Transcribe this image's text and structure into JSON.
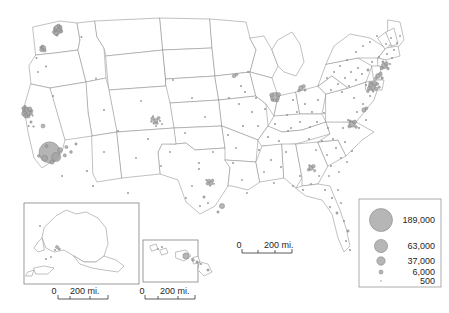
{
  "map": {
    "title": "United States population distribution dot/graduated-circle map",
    "background_color": "#ffffff",
    "state_outline_color": "#8d8d8d",
    "symbol_fill_color": "#a3a3a3",
    "symbol_stroke_color": "#787878"
  },
  "legend": {
    "name": "graduated-circle-legend",
    "border_color": "#8a8a8a",
    "entries": [
      {
        "label": "189,000",
        "radius": 11.5,
        "value": 189000
      },
      {
        "label": "63,000",
        "radius": 6.6,
        "value": 63000
      },
      {
        "label": "37,000",
        "radius": 4.2,
        "value": 37000
      },
      {
        "label": "6,000",
        "radius": 2.0,
        "value": 6000
      },
      {
        "label": "500",
        "radius": 0.8,
        "value": 500
      }
    ]
  },
  "scalebars": [
    {
      "name": "main-map-scalebar",
      "zero": "0",
      "distance": "200 mi."
    },
    {
      "name": "alaska-inset-scalebar",
      "zero": "0",
      "distance": "200 mi."
    },
    {
      "name": "hawaii-inset-scalebar",
      "zero": "0",
      "distance": "200 mi."
    }
  ],
  "insets": [
    {
      "name": "alaska-inset",
      "label": "Alaska"
    },
    {
      "name": "hawaii-inset",
      "label": "Hawaii"
    }
  ],
  "symbols": {
    "conus": [
      [
        55.5,
        30.0,
        2.2
      ],
      [
        57.8,
        28.4,
        3.6
      ],
      [
        59.4,
        30.6,
        2.9
      ],
      [
        56.2,
        33.0,
        2.6
      ],
      [
        60.1,
        27.2,
        2.0
      ],
      [
        53.8,
        32.1,
        1.5
      ],
      [
        58.6,
        25.6,
        1.6
      ],
      [
        61.3,
        31.4,
        1.4
      ],
      [
        57.0,
        35.0,
        1.2
      ],
      [
        54.4,
        27.8,
        1.1
      ],
      [
        43.2,
        48.0,
        2.6
      ],
      [
        41.6,
        49.8,
        2.0
      ],
      [
        44.6,
        50.4,
        1.6
      ],
      [
        42.2,
        46.3,
        1.3
      ],
      [
        40.4,
        47.4,
        1.0
      ],
      [
        36.5,
        58.0,
        1.0
      ],
      [
        81.5,
        37.0,
        1.0
      ],
      [
        46.0,
        66.5,
        1.0
      ],
      [
        38.0,
        72.0,
        0.9
      ],
      [
        96.0,
        78.5,
        0.9
      ],
      [
        53.0,
        96.0,
        1.0
      ],
      [
        104.0,
        110.0,
        1.0
      ],
      [
        25.6,
        110.0,
        3.2
      ],
      [
        27.4,
        112.4,
        4.0
      ],
      [
        24.2,
        113.6,
        2.6
      ],
      [
        29.6,
        109.0,
        2.2
      ],
      [
        26.0,
        115.8,
        2.4
      ],
      [
        30.8,
        113.0,
        1.8
      ],
      [
        23.4,
        108.2,
        1.6
      ],
      [
        28.4,
        116.4,
        1.5
      ],
      [
        31.8,
        110.6,
        1.2
      ],
      [
        25.0,
        106.4,
        1.2
      ],
      [
        32.6,
        115.4,
        1.0
      ],
      [
        31.0,
        122.0,
        1.2
      ],
      [
        28.6,
        126.0,
        1.0
      ],
      [
        43.0,
        126.0,
        2.0
      ],
      [
        33.5,
        126.5,
        1.1
      ],
      [
        49.6,
        152.4,
        10.6
      ],
      [
        56.2,
        157.0,
        4.6
      ],
      [
        44.6,
        158.2,
        3.0
      ],
      [
        60.0,
        150.0,
        2.4
      ],
      [
        52.0,
        162.0,
        2.2
      ],
      [
        64.8,
        155.4,
        1.6
      ],
      [
        46.6,
        146.0,
        1.5
      ],
      [
        38.8,
        156.0,
        1.4
      ],
      [
        66.4,
        147.0,
        1.6
      ],
      [
        71.0,
        152.0,
        1.4
      ],
      [
        76.0,
        144.0,
        1.2
      ],
      [
        87.0,
        171.0,
        1.1
      ],
      [
        62.0,
        176.0,
        1.0
      ],
      [
        93.0,
        186.0,
        1.0
      ],
      [
        128.0,
        193.0,
        1.0
      ],
      [
        118.0,
        131.0,
        1.0
      ],
      [
        104.0,
        152.0,
        0.9
      ],
      [
        141.0,
        101.0,
        0.9
      ],
      [
        152.6,
        118.6,
        1.8
      ],
      [
        155.8,
        120.6,
        2.1
      ],
      [
        158.6,
        118.0,
        1.6
      ],
      [
        154.2,
        123.0,
        1.4
      ],
      [
        157.0,
        123.2,
        1.2
      ],
      [
        151.4,
        121.4,
        1.1
      ],
      [
        160.0,
        121.0,
        1.0
      ],
      [
        153.0,
        116.2,
        1.0
      ],
      [
        156.0,
        126.0,
        0.9
      ],
      [
        162.0,
        124.0,
        0.9
      ],
      [
        148.0,
        139.0,
        1.0
      ],
      [
        170.0,
        152.0,
        0.9
      ],
      [
        136.0,
        158.0,
        0.9
      ],
      [
        161.0,
        166.0,
        0.9
      ],
      [
        185.0,
        133.0,
        0.9
      ],
      [
        192.0,
        98.0,
        0.9
      ],
      [
        173.0,
        80.0,
        0.9
      ],
      [
        205.0,
        117.0,
        0.9
      ],
      [
        213.0,
        152.0,
        0.9
      ],
      [
        199.0,
        163.0,
        1.0
      ],
      [
        209.0,
        181.0,
        1.8
      ],
      [
        211.2,
        183.0,
        2.0
      ],
      [
        207.6,
        183.4,
        1.6
      ],
      [
        212.6,
        180.4,
        1.3
      ],
      [
        206.4,
        180.0,
        1.1
      ],
      [
        210.0,
        185.6,
        1.1
      ],
      [
        214.0,
        183.8,
        0.9
      ],
      [
        204.0,
        197.0,
        1.2
      ],
      [
        208.0,
        203.0,
        1.0
      ],
      [
        200.0,
        206.0,
        1.0
      ],
      [
        222.0,
        206.0,
        2.6
      ],
      [
        218.0,
        212.0,
        1.2
      ],
      [
        199.0,
        169.0,
        1.0
      ],
      [
        192.0,
        186.0,
        0.9
      ],
      [
        186.0,
        198.0,
        0.9
      ],
      [
        233.0,
        163.0,
        1.0
      ],
      [
        242.0,
        180.0,
        0.9
      ],
      [
        247.0,
        193.0,
        0.9
      ],
      [
        236.0,
        148.0,
        0.9
      ],
      [
        228.0,
        135.0,
        1.0
      ],
      [
        243.0,
        126.0,
        1.0
      ],
      [
        252.0,
        112.0,
        1.0
      ],
      [
        239.0,
        104.0,
        1.0
      ],
      [
        229.0,
        98.0,
        1.0
      ],
      [
        245.0,
        92.0,
        1.0
      ],
      [
        256.0,
        98.0,
        1.0
      ],
      [
        265.0,
        109.0,
        1.0
      ],
      [
        258.0,
        126.0,
        1.0
      ],
      [
        268.0,
        137.0,
        1.0
      ],
      [
        275.0,
        124.0,
        1.0
      ],
      [
        259.0,
        150.0,
        1.0
      ],
      [
        271.0,
        160.0,
        1.0
      ],
      [
        264.0,
        172.0,
        0.9
      ],
      [
        274.0,
        183.0,
        0.9
      ],
      [
        281.0,
        167.0,
        1.0
      ],
      [
        286.0,
        152.0,
        1.0
      ],
      [
        279.0,
        141.0,
        1.0
      ],
      [
        288.0,
        131.0,
        1.0
      ],
      [
        275.0,
        97.0,
        4.6
      ],
      [
        278.4,
        94.6,
        2.2
      ],
      [
        271.6,
        95.0,
        2.0
      ],
      [
        277.0,
        100.4,
        1.6
      ],
      [
        272.4,
        100.0,
        1.4
      ],
      [
        234.0,
        76.0,
        1.8
      ],
      [
        236.6,
        74.6,
        1.4
      ],
      [
        241.0,
        86.0,
        1.0
      ],
      [
        248.0,
        72.0,
        1.0
      ],
      [
        301.0,
        88.0,
        2.4
      ],
      [
        303.6,
        86.2,
        1.8
      ],
      [
        299.0,
        90.6,
        1.4
      ],
      [
        305.0,
        90.0,
        1.2
      ],
      [
        293.0,
        100.0,
        1.0
      ],
      [
        297.0,
        112.0,
        1.0
      ],
      [
        287.0,
        115.0,
        1.0
      ],
      [
        305.0,
        104.0,
        1.0
      ],
      [
        312.0,
        112.0,
        1.0
      ],
      [
        300.0,
        122.0,
        1.0
      ],
      [
        291.0,
        128.0,
        1.0
      ],
      [
        310.0,
        127.0,
        0.9
      ],
      [
        318.0,
        100.0,
        1.0
      ],
      [
        324.0,
        113.0,
        1.0
      ],
      [
        317.0,
        122.0,
        1.0
      ],
      [
        328.0,
        128.0,
        1.0
      ],
      [
        309.0,
        139.0,
        1.0
      ],
      [
        322.0,
        141.0,
        1.0
      ],
      [
        333.0,
        139.0,
        1.0
      ],
      [
        316.0,
        150.0,
        0.9
      ],
      [
        327.0,
        155.0,
        0.9
      ],
      [
        311.0,
        168.0,
        2.4
      ],
      [
        313.4,
        166.2,
        1.8
      ],
      [
        308.6,
        169.8,
        1.4
      ],
      [
        314.6,
        170.6,
        1.2
      ],
      [
        309.4,
        165.4,
        1.1
      ],
      [
        300.0,
        176.0,
        1.0
      ],
      [
        293.0,
        186.0,
        1.0
      ],
      [
        303.0,
        190.0,
        1.0
      ],
      [
        311.0,
        184.0,
        0.9
      ],
      [
        319.0,
        176.0,
        0.9
      ],
      [
        331.0,
        166.0,
        1.0
      ],
      [
        341.0,
        158.0,
        1.0
      ],
      [
        336.0,
        148.0,
        1.0
      ],
      [
        345.0,
        142.0,
        1.0
      ],
      [
        352.0,
        151.0,
        1.0
      ],
      [
        329.0,
        176.0,
        0.9
      ],
      [
        339.0,
        172.0,
        0.9
      ],
      [
        347.0,
        162.0,
        0.9
      ],
      [
        325.0,
        190.0,
        1.0
      ],
      [
        332.0,
        198.0,
        1.1
      ],
      [
        338.0,
        190.0,
        0.9
      ],
      [
        330.0,
        207.0,
        1.0
      ],
      [
        337.0,
        213.0,
        1.2
      ],
      [
        341.0,
        203.0,
        0.9
      ],
      [
        344.0,
        221.0,
        1.0
      ],
      [
        348.0,
        231.0,
        1.2
      ],
      [
        346.0,
        241.0,
        1.0
      ],
      [
        350.0,
        250.0,
        1.1
      ],
      [
        357.0,
        112.0,
        1.0
      ],
      [
        363.0,
        104.0,
        1.0
      ],
      [
        354.0,
        98.0,
        1.0
      ],
      [
        366.0,
        120.0,
        1.0
      ],
      [
        359.0,
        128.0,
        1.0
      ],
      [
        370.0,
        96.0,
        1.0
      ],
      [
        348.0,
        120.0,
        1.0
      ],
      [
        343.0,
        128.0,
        1.0
      ],
      [
        352.0,
        124.0,
        3.2
      ],
      [
        354.6,
        122.0,
        2.0
      ],
      [
        349.4,
        126.4,
        1.6
      ],
      [
        356.0,
        127.0,
        1.4
      ],
      [
        350.0,
        121.0,
        1.2
      ],
      [
        364.0,
        110.0,
        2.2
      ],
      [
        366.4,
        108.2,
        1.5
      ],
      [
        372.0,
        86.0,
        3.6
      ],
      [
        374.4,
        83.6,
        2.6
      ],
      [
        369.6,
        88.2,
        2.2
      ],
      [
        376.2,
        88.8,
        1.8
      ],
      [
        370.4,
        83.0,
        1.6
      ],
      [
        377.4,
        84.0,
        1.4
      ],
      [
        367.8,
        91.4,
        1.3
      ],
      [
        379.2,
        87.2,
        1.2
      ],
      [
        373.0,
        91.0,
        1.2
      ],
      [
        366.0,
        85.0,
        1.1
      ],
      [
        378.0,
        76.0,
        2.4
      ],
      [
        380.4,
        73.8,
        1.8
      ],
      [
        375.8,
        78.2,
        1.4
      ],
      [
        382.2,
        78.0,
        1.2
      ],
      [
        384.0,
        66.0,
        2.8
      ],
      [
        386.4,
        63.8,
        2.0
      ],
      [
        381.8,
        68.2,
        1.5
      ],
      [
        388.0,
        68.6,
        1.3
      ],
      [
        383.0,
        62.0,
        1.2
      ],
      [
        390.0,
        64.0,
        1.0
      ],
      [
        392.0,
        58.0,
        1.0
      ],
      [
        387.0,
        54.0,
        1.0
      ],
      [
        379.0,
        57.0,
        1.0
      ],
      [
        372.0,
        62.0,
        1.0
      ],
      [
        394.0,
        50.0,
        1.0
      ],
      [
        386.0,
        44.0,
        0.9
      ],
      [
        397.0,
        43.0,
        0.9
      ],
      [
        391.0,
        38.0,
        0.9
      ],
      [
        400.0,
        36.0,
        0.9
      ],
      [
        368.0,
        70.0,
        1.2
      ],
      [
        362.0,
        74.0,
        1.0
      ],
      [
        356.0,
        80.0,
        1.0
      ],
      [
        349.0,
        86.0,
        1.0
      ],
      [
        342.0,
        92.0,
        1.0
      ],
      [
        358.0,
        68.0,
        1.0
      ],
      [
        351.0,
        72.0,
        1.0
      ],
      [
        345.0,
        78.0,
        1.0
      ],
      [
        338.0,
        84.0,
        1.0
      ],
      [
        331.0,
        90.0,
        1.0
      ],
      [
        347.0,
        60.0,
        1.0
      ],
      [
        340.0,
        66.0,
        1.0
      ],
      [
        334.0,
        72.0,
        1.0
      ],
      [
        327.0,
        78.0,
        0.9
      ],
      [
        356.0,
        52.0,
        1.0
      ],
      [
        363.0,
        46.0,
        0.9
      ],
      [
        370.0,
        42.0,
        0.9
      ],
      [
        377.0,
        36.0,
        0.9
      ]
    ],
    "alaska": [
      [
        57.0,
        247.0,
        1.6
      ],
      [
        59.2,
        249.0,
        1.2
      ],
      [
        55.0,
        250.0,
        1.0
      ],
      [
        46.0,
        259.0,
        1.0
      ],
      [
        51.0,
        257.0,
        0.9
      ],
      [
        40.0,
        226.0,
        0.9
      ]
    ],
    "hawaii": [
      [
        186.0,
        256.0,
        3.2
      ],
      [
        193.0,
        260.0,
        1.4
      ],
      [
        197.0,
        262.0,
        1.2
      ],
      [
        201.0,
        264.0,
        1.0
      ],
      [
        162.0,
        247.0,
        1.0
      ],
      [
        158.0,
        249.0,
        0.9
      ],
      [
        208.0,
        270.0,
        1.2
      ]
    ]
  }
}
